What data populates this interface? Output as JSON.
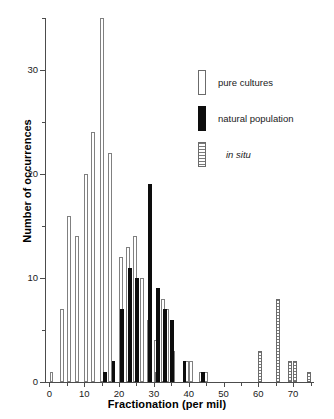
{
  "chart_data": {
    "type": "bar",
    "title": "",
    "xlabel": "Fractionation (per mil)",
    "ylabel": "Number of occurrences",
    "xlim": [
      -1,
      76
    ],
    "ylim": [
      0,
      35
    ],
    "xticks": [
      0,
      10,
      20,
      30,
      40,
      50,
      60,
      70
    ],
    "xticks_minor": [
      5,
      15,
      25,
      35,
      45,
      55,
      65,
      75
    ],
    "yticks": [
      0,
      10,
      20,
      30
    ],
    "yticks_minor": [
      5,
      15,
      25,
      35
    ],
    "grid": false,
    "legend_position": "upper right",
    "bar_width": 1.1,
    "series": [
      {
        "name": "pure cultures",
        "style": "open",
        "color": "#ffffff",
        "edge_color": "#808080",
        "points": [
          {
            "x": 0.6,
            "y": 1
          },
          {
            "x": 3.6,
            "y": 7
          },
          {
            "x": 5.6,
            "y": 16
          },
          {
            "x": 7.9,
            "y": 14
          },
          {
            "x": 10.4,
            "y": 20
          },
          {
            "x": 12.6,
            "y": 24
          },
          {
            "x": 15.2,
            "y": 35
          },
          {
            "x": 17.4,
            "y": 22
          },
          {
            "x": 20.5,
            "y": 12
          },
          {
            "x": 22.6,
            "y": 13
          },
          {
            "x": 24.6,
            "y": 14
          },
          {
            "x": 26.6,
            "y": 10
          },
          {
            "x": 28.5,
            "y": 6
          },
          {
            "x": 30.6,
            "y": 4
          },
          {
            "x": 32.6,
            "y": 8
          },
          {
            "x": 33.8,
            "y": 7
          },
          {
            "x": 35.6,
            "y": 3
          },
          {
            "x": 39.6,
            "y": 2
          },
          {
            "x": 40.6,
            "y": 2
          },
          {
            "x": 43.6,
            "y": 1
          },
          {
            "x": 45.0,
            "y": 1
          }
        ]
      },
      {
        "name": "natural population",
        "style": "filled",
        "color": "#0d0d0d",
        "edge_color": "#0d0d0d",
        "points": [
          {
            "x": 16.0,
            "y": 1
          },
          {
            "x": 18.4,
            "y": 2
          },
          {
            "x": 20.9,
            "y": 7
          },
          {
            "x": 23.1,
            "y": 11
          },
          {
            "x": 25.1,
            "y": 10
          },
          {
            "x": 28.9,
            "y": 19
          },
          {
            "x": 31.2,
            "y": 9
          },
          {
            "x": 33.2,
            "y": 7
          },
          {
            "x": 35.2,
            "y": 6
          },
          {
            "x": 38.8,
            "y": 2
          },
          {
            "x": 44.2,
            "y": 1
          }
        ]
      },
      {
        "name": "in situ",
        "style": "hatched",
        "color": "#ffffff",
        "edge_color": "#6b6b6b",
        "points": [
          {
            "x": 30.9,
            "y": 1
          },
          {
            "x": 60.6,
            "y": 3
          },
          {
            "x": 65.6,
            "y": 8
          },
          {
            "x": 69.1,
            "y": 2
          },
          {
            "x": 70.6,
            "y": 2
          },
          {
            "x": 74.6,
            "y": 1
          }
        ]
      }
    ]
  },
  "legend": {
    "items": [
      {
        "label": "pure cultures",
        "style": "pure"
      },
      {
        "label": "natural population",
        "style": "natural"
      },
      {
        "label": "in situ",
        "style": "insitu"
      }
    ]
  }
}
